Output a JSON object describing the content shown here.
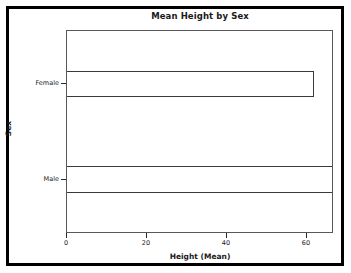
{
  "chart_data": {
    "type": "bar",
    "orientation": "horizontal",
    "title": "Mean Height by Sex",
    "xlabel": "Height (Mean)",
    "ylabel": "Sex",
    "categories": [
      "Female",
      "Male"
    ],
    "values": [
      62.3,
      67.0
    ],
    "xlim": [
      0,
      66.8
    ],
    "xticks": [
      0,
      20,
      40,
      60
    ],
    "xtick_labels": [
      "0",
      "20",
      "40",
      "60"
    ],
    "ytick_labels": [
      "Female",
      "Male"
    ],
    "grid": false,
    "legend": false,
    "bar_fill_color": "#ffffff",
    "bar_edge_color": "#3a3a3c",
    "axes_color": "#58585a",
    "background_color": "#ffffff",
    "border_color": "#000000"
  },
  "axis": {
    "xticks": [
      {
        "label": "0",
        "value": 0
      },
      {
        "label": "20",
        "value": 20
      },
      {
        "label": "40",
        "value": 40
      },
      {
        "label": "60",
        "value": 60
      }
    ],
    "yticks": [
      {
        "label": "Female",
        "value": 62.3
      },
      {
        "label": "Male",
        "value": 67.0
      }
    ]
  }
}
